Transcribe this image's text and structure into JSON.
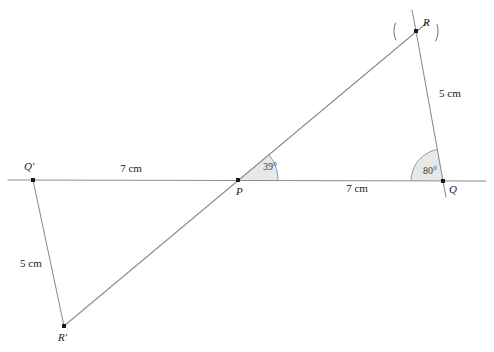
{
  "figure": {
    "type": "geometry-construction",
    "background_color": "#ffffff",
    "line_color": "#8c8c8c",
    "dark_line_color": "#6e6e6e",
    "point_color": "#1a1a1a",
    "angle_fill": "#e8e8e8",
    "angle_stroke": "#9a9a9a",
    "text_color": "#1a1a1a"
  },
  "points": {
    "Qprime": {
      "label": "Q′",
      "x": 33,
      "y": 180,
      "label_x": 24,
      "label_y": 170
    },
    "P": {
      "label": "P",
      "x": 238,
      "y": 180,
      "label_x": 236,
      "label_y": 195
    },
    "Q": {
      "label": "Q",
      "x": 443,
      "y": 181,
      "label_x": 449,
      "label_y": 193
    },
    "R": {
      "label": "R",
      "x": 416,
      "y": 31,
      "label_x": 423,
      "label_y": 26
    },
    "Rprime": {
      "label": "R′",
      "x": 64,
      "y": 326,
      "label_x": 58,
      "label_y": 341
    }
  },
  "segments": [
    {
      "name": "baseline",
      "from": "left-edge",
      "to": "right-edge",
      "x1": 8,
      "y1": 180,
      "x2": 486,
      "y2": 181
    },
    {
      "name": "transversal",
      "from": "Rprime",
      "to": "beyond-R",
      "x1": 64,
      "y1": 326,
      "x2": 429,
      "y2": 21
    },
    {
      "name": "QR-side",
      "from": "Q",
      "to": "R",
      "x1": 443,
      "y1": 181,
      "x2": 416,
      "y2": 31
    },
    {
      "name": "QR-extension",
      "from": "R",
      "to": "above",
      "x1": 416,
      "y1": 31,
      "x2": 412,
      "y2": 10
    },
    {
      "name": "QR-below",
      "from": "Q",
      "to": "below",
      "x1": 443,
      "y1": 181,
      "x2": 446,
      "y2": 197
    },
    {
      "name": "QprimeRprime",
      "from": "Qprime",
      "to": "Rprime",
      "x1": 33,
      "y1": 180,
      "x2": 64,
      "y2": 326
    }
  ],
  "arcs": [
    {
      "name": "construction-arc-1",
      "cx": 416,
      "cy": 31,
      "r": 22,
      "a1": 158,
      "a2": 205
    },
    {
      "name": "construction-arc-2",
      "cx": 416,
      "cy": 31,
      "r": 22,
      "a1": -28,
      "a2": 18
    }
  ],
  "angles": [
    {
      "name": "angle-at-P",
      "vertex": "P",
      "value": "39°",
      "vx": 238,
      "vy": 180,
      "radius": 40,
      "start_deg": 0,
      "end_deg": 39,
      "text_x": 263,
      "text_y": 170
    },
    {
      "name": "angle-at-Q",
      "vertex": "Q",
      "value": "80°",
      "vx": 443,
      "vy": 181,
      "radius": 32,
      "start_deg": 100,
      "end_deg": 180,
      "text_x": 423,
      "text_y": 174
    }
  ],
  "measurements": [
    {
      "name": "length-QprimeP",
      "text": "7 cm",
      "x": 131,
      "y": 172,
      "anchor": "middle"
    },
    {
      "name": "length-PQ",
      "text": "7 cm",
      "x": 357,
      "y": 192,
      "anchor": "middle"
    },
    {
      "name": "length-QR",
      "text": "5 cm",
      "x": 439,
      "y": 97,
      "anchor": "start"
    },
    {
      "name": "length-QprimeRprime",
      "text": "5 cm",
      "x": 20,
      "y": 267,
      "anchor": "start"
    }
  ]
}
